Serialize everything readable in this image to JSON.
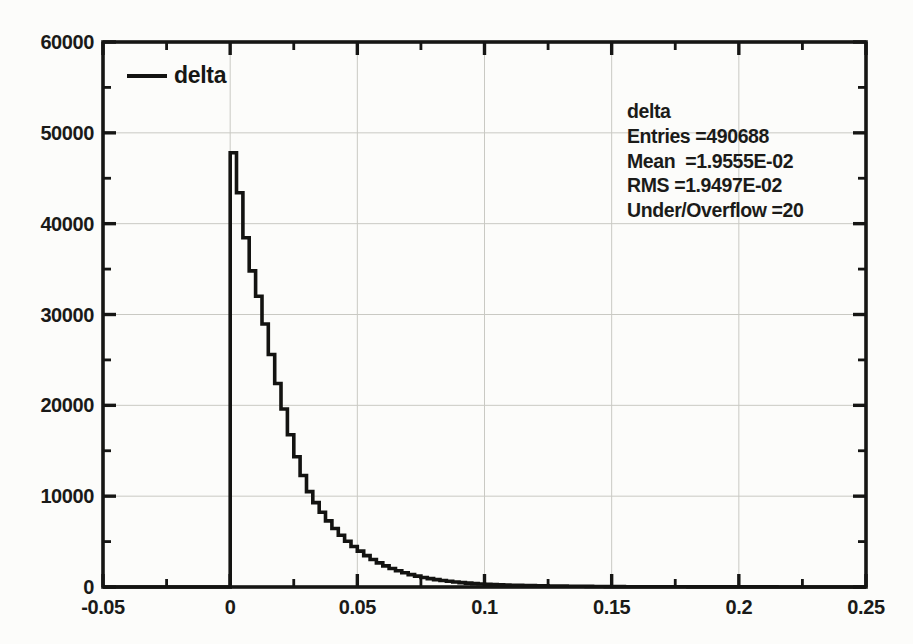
{
  "page": {
    "background": "#fcfcfa"
  },
  "legend": {
    "label": "delta"
  },
  "stats_box": {
    "title": "delta",
    "entries": 490688,
    "mean": "1.9555E-02",
    "rms": "1.9497E-02",
    "under_overflow": 20,
    "lines": [
      "delta",
      "Entries =490688",
      "Mean  =1.9555E-02",
      "RMS =1.9497E-02",
      "Under/Overflow =20"
    ]
  },
  "chart_data": {
    "type": "bar",
    "subtype": "step-histogram",
    "title": "",
    "xlabel": "",
    "ylabel": "",
    "xlim": [
      -0.05,
      0.25
    ],
    "ylim": [
      0,
      60000
    ],
    "grid": true,
    "legend_position": "top-left-inside",
    "x_major_ticks": [
      -0.05,
      0,
      0.05,
      0.1,
      0.15,
      0.2,
      0.25
    ],
    "x_tick_labels": [
      "-0.05",
      "0",
      "0.05",
      "0.1",
      "0.15",
      "0.2",
      "0.25"
    ],
    "x_minor_ticks": [
      -0.025,
      0.025,
      0.075,
      0.125,
      0.175,
      0.225
    ],
    "y_major_ticks": [
      0,
      10000,
      20000,
      30000,
      40000,
      50000,
      60000
    ],
    "y_tick_labels": [
      "0",
      "10000",
      "20000",
      "30000",
      "40000",
      "50000",
      "60000"
    ],
    "y_minor_ticks": [
      5000,
      15000,
      25000,
      35000,
      45000,
      55000
    ],
    "series": [
      {
        "name": "delta",
        "color": "#131311",
        "baseline_start": -0.05,
        "bin_start": 0.0,
        "bin_width": 0.0025,
        "values": [
          47800,
          43400,
          38450,
          34800,
          32000,
          28950,
          25600,
          22400,
          19600,
          16770,
          14350,
          12280,
          10500,
          9290,
          8220,
          7280,
          6440,
          5700,
          5040,
          4460,
          3950,
          3460,
          3030,
          2655,
          2325,
          2037,
          1784,
          1563,
          1369,
          1199,
          1050,
          923,
          812,
          714,
          628,
          552,
          486,
          427,
          376,
          330,
          290,
          264,
          241,
          219,
          200,
          182,
          166,
          151,
          138,
          125,
          114,
          104,
          95,
          86,
          79,
          72,
          65,
          59,
          54,
          49,
          45,
          41,
          38,
          35,
          32,
          29,
          27,
          25,
          23,
          21,
          19,
          17,
          16,
          15,
          13,
          12,
          11,
          10,
          9,
          8,
          8,
          7,
          7,
          6,
          6,
          6,
          5,
          5,
          4,
          4,
          4,
          4,
          3,
          3,
          3,
          3,
          2,
          2,
          2,
          2
        ]
      }
    ],
    "colors": {
      "frame": "#161614",
      "grid": "#c9c9c3",
      "curve": "#131311",
      "text": "#1a1a18"
    }
  }
}
